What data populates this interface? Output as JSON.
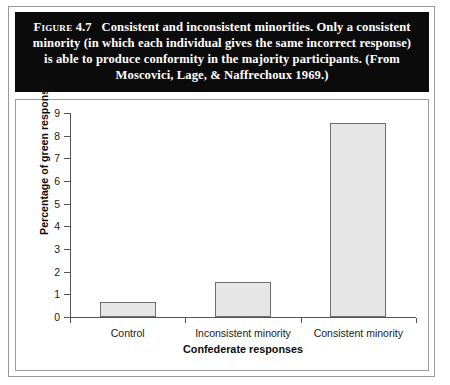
{
  "figure": {
    "label": "Figure",
    "number": "4.7",
    "caption": "Consistent and inconsistent minorities. Only a consistent minority (in which each individual gives the same incorrect response) is able to produce conformity in the majority participants. (From Moscovici, Lage, & Naffrechoux 1969.)",
    "caption_line_1": "Consistent and inconsistent minorities.",
    "caption_line_2": "Only a consistent minority (in which each individual",
    "caption_line_3": "gives the same incorrect response) is able to produce",
    "caption_line_4": "conformity in the majority participants. (From",
    "caption_line_5": "Moscovici, Lage, & Naffrechoux 1969.)",
    "caption_background": "#0b0b0b",
    "caption_color": "#ffffff"
  },
  "chart_data": {
    "type": "bar",
    "title": "",
    "categories": [
      "Control",
      "Inconsistent minority",
      "Consistent minority"
    ],
    "values": [
      0.65,
      1.55,
      8.55
    ],
    "xlabel": "Confederate responses",
    "ylabel": "Percentage of green responses",
    "ylim": [
      0,
      9
    ],
    "ytick_labels": [
      "0",
      "1",
      "2",
      "3",
      "4",
      "5",
      "6",
      "7",
      "8",
      "9"
    ],
    "ytick_values": [
      0,
      1,
      2,
      3,
      4,
      5,
      6,
      7,
      8,
      9
    ],
    "grid": false,
    "legend": false,
    "bar_fill": "#e6e6e6",
    "bar_edge": "#6e6e6e",
    "axis_color": "#555555"
  }
}
